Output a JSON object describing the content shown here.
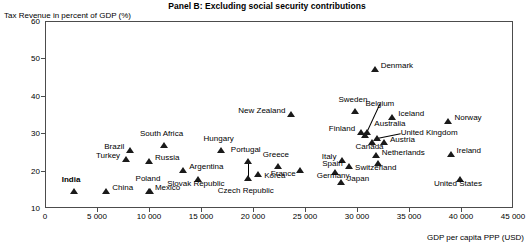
{
  "chart_data": {
    "type": "scatter",
    "title": "Panel B: Excluding social security contributions",
    "xlabel": "GDP per capita PPP (USD)",
    "ylabel": "Tax Revenue in percent of GDP (%)",
    "xlim": [
      0,
      45000
    ],
    "ylim": [
      10,
      60
    ],
    "xticks": [
      0,
      5000,
      10000,
      15000,
      20000,
      25000,
      30000,
      35000,
      40000,
      45000
    ],
    "xtick_labels": [
      "0",
      "5 000",
      "10 000",
      "15 000",
      "20 000",
      "25 000",
      "30 000",
      "35 000",
      "40 000",
      "45 000"
    ],
    "yticks": [
      10,
      20,
      30,
      40,
      50,
      60
    ],
    "ytick_labels": [
      "10",
      "20",
      "30",
      "40",
      "50",
      "60"
    ],
    "grid": false,
    "legend": "none",
    "marker": "triangle",
    "marker_color": "#1a1a1a",
    "points": [
      {
        "name": "India",
        "x": 2700,
        "y": 14.7,
        "label_dx": -3,
        "label_dy": -12,
        "anchor": "center",
        "bold": true
      },
      {
        "name": "China",
        "x": 5800,
        "y": 14.7,
        "label_dx": 6,
        "label_dy": -4,
        "anchor": "left",
        "bold": false
      },
      {
        "name": "Brazil",
        "x": 8100,
        "y": 25.8,
        "label_dx": -6,
        "label_dy": -4,
        "anchor": "right",
        "bold": false
      },
      {
        "name": "Turkey",
        "x": 7700,
        "y": 23.4,
        "label_dx": -6,
        "label_dy": -4,
        "anchor": "right",
        "bold": false
      },
      {
        "name": "Russia",
        "x": 9900,
        "y": 22.8,
        "label_dx": 6,
        "label_dy": -4,
        "anchor": "left",
        "bold": false
      },
      {
        "name": "South Africa",
        "x": 11300,
        "y": 27.1,
        "label_dx": -2,
        "label_dy": -12,
        "anchor": "center",
        "bold": false
      },
      {
        "name": "Mexico",
        "x": 9900,
        "y": 14.9,
        "label_dx": 6,
        "label_dy": -4,
        "anchor": "left",
        "bold": false
      },
      {
        "name": "Poland",
        "x": 10000,
        "y": 14.9,
        "label_dx": -2,
        "label_dy": -13,
        "anchor": "center",
        "bold": false
      },
      {
        "name": "Argentina",
        "x": 13200,
        "y": 20.4,
        "label_dx": 6,
        "label_dy": -4,
        "anchor": "left",
        "bold": false
      },
      {
        "name": "Slovak Republic",
        "x": 14600,
        "y": 18.0,
        "label_dx": -2,
        "label_dy": 4,
        "anchor": "center",
        "bold": false
      },
      {
        "name": "Hungary",
        "x": 16800,
        "y": 25.9,
        "label_dx": -2,
        "label_dy": -12,
        "anchor": "center",
        "bold": false
      },
      {
        "name": "Portugal",
        "x": 19400,
        "y": 22.8,
        "label_dx": -2,
        "label_dy": -12,
        "anchor": "center",
        "bold": false
      },
      {
        "name": "Czech Republic",
        "x": 19400,
        "y": 18.4,
        "label_dx": -2,
        "label_dy": 12,
        "anchor": "center",
        "bold": false,
        "leader": true
      },
      {
        "name": "Korea",
        "x": 20400,
        "y": 19.4,
        "label_dx": 6,
        "label_dy": 1,
        "anchor": "left",
        "bold": false
      },
      {
        "name": "Greece",
        "x": 22300,
        "y": 21.4,
        "label_dx": -2,
        "label_dy": -12,
        "anchor": "center",
        "bold": false
      },
      {
        "name": "France",
        "x": 24400,
        "y": 20.5,
        "label_dx": -4,
        "label_dy": 3,
        "anchor": "right",
        "bold": false
      },
      {
        "name": "New Zealand",
        "x": 23600,
        "y": 35.5,
        "label_dx": -6,
        "label_dy": -4,
        "anchor": "right",
        "bold": false
      },
      {
        "name": "Germany",
        "x": 27800,
        "y": 19.8,
        "label_dx": -2,
        "label_dy": 3,
        "anchor": "center",
        "bold": false
      },
      {
        "name": "Japan",
        "x": 28400,
        "y": 17.2,
        "label_dx": 6,
        "label_dy": -4,
        "anchor": "left",
        "bold": false
      },
      {
        "name": "Italy",
        "x": 28500,
        "y": 23.1,
        "label_dx": -6,
        "label_dy": -4,
        "anchor": "right",
        "bold": false
      },
      {
        "name": "Spain",
        "x": 29100,
        "y": 21.5,
        "label_dx": -6,
        "label_dy": -3,
        "anchor": "right",
        "bold": false
      },
      {
        "name": "Sweden",
        "x": 29700,
        "y": 36.1,
        "label_dx": -2,
        "label_dy": -12,
        "anchor": "center",
        "bold": false
      },
      {
        "name": "Finland",
        "x": 30300,
        "y": 30.6,
        "label_dx": -6,
        "label_dy": -4,
        "anchor": "right",
        "bold": false
      },
      {
        "name": "Belgium",
        "x": 30700,
        "y": 29.8,
        "label_dx": 0,
        "label_dy": 0,
        "anchor": "leader",
        "bold": false,
        "leader": true
      },
      {
        "name": "Australia",
        "x": 30900,
        "y": 30.6,
        "label_dx": 7,
        "label_dy": -9,
        "anchor": "left",
        "bold": false
      },
      {
        "name": "Canada",
        "x": 31300,
        "y": 27.8,
        "label_dx": -2,
        "label_dy": 4,
        "anchor": "center",
        "bold": false
      },
      {
        "name": "Netherlands",
        "x": 31700,
        "y": 24.5,
        "label_dx": 6,
        "label_dy": -3,
        "anchor": "left",
        "bold": false
      },
      {
        "name": "Austria",
        "x": 32500,
        "y": 27.8,
        "label_dx": 6,
        "label_dy": -3,
        "anchor": "left",
        "bold": false
      },
      {
        "name": "Switzerland",
        "x": 31900,
        "y": 22.2,
        "label_dx": -2,
        "label_dy": 4,
        "anchor": "center",
        "bold": false
      },
      {
        "name": "United Kingdom",
        "x": 31800,
        "y": 29.1,
        "label_dx": 0,
        "label_dy": 0,
        "anchor": "leader",
        "bold": false,
        "leader": true
      },
      {
        "name": "Iceland",
        "x": 33300,
        "y": 34.6,
        "label_dx": 6,
        "label_dy": -4,
        "anchor": "left",
        "bold": false
      },
      {
        "name": "Denmark",
        "x": 31600,
        "y": 47.5,
        "label_dx": 6,
        "label_dy": -4,
        "anchor": "left",
        "bold": false
      },
      {
        "name": "Norway",
        "x": 38700,
        "y": 33.5,
        "label_dx": 6,
        "label_dy": -4,
        "anchor": "left",
        "bold": false
      },
      {
        "name": "Ireland",
        "x": 38900,
        "y": 24.7,
        "label_dx": 6,
        "label_dy": -4,
        "anchor": "left",
        "bold": false
      },
      {
        "name": "United States",
        "x": 39800,
        "y": 18.0,
        "label_dx": -2,
        "label_dy": 4,
        "anchor": "center",
        "bold": false
      }
    ],
    "leaders": [
      {
        "from_x": 30700,
        "from_y": 29.8,
        "to_label": "Belgium",
        "label_x": 32100,
        "label_y": 38.2
      },
      {
        "from_x": 31800,
        "from_y": 29.1,
        "to_label": "United Kingdom",
        "label_x": 34100,
        "label_y": 30.4
      },
      {
        "from_x": 19400,
        "from_y": 18.4,
        "to_label": "Czech Republic",
        "label_x": 19400,
        "label_y": 22.6
      }
    ]
  }
}
